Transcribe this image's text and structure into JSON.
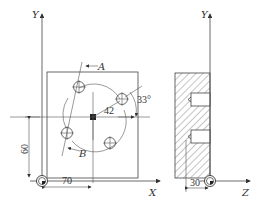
{
  "figure": {
    "front_view": {
      "axis_labels": {
        "x": "X",
        "y": "Y"
      },
      "section_labels": {
        "a": "A",
        "b": "B"
      },
      "dimensions": {
        "x_offset": "70",
        "y_offset": "60",
        "radius": "42",
        "angle": "33°"
      }
    },
    "side_view": {
      "axis_labels": {
        "y": "Y",
        "z": "Z"
      },
      "dimensions": {
        "z_offset": "30"
      }
    }
  }
}
